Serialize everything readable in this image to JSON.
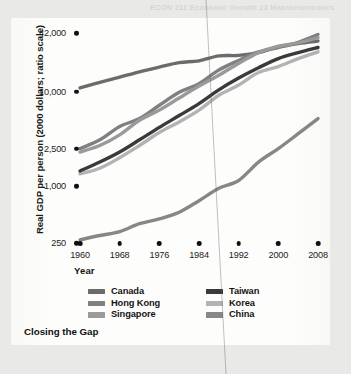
{
  "figure": {
    "caption": "Closing the Gap",
    "ghost_text": "ECON 211 Economic Growth 23 Macroeconomics",
    "card_bg": "#fdfdfc",
    "page_bg": "#e9e9e7"
  },
  "axes": {
    "y_title": "Real GDP per person (2000 dollars; ratio scale)",
    "x_title": "Year",
    "y_ticklabels": [
      "42,000",
      "10,000",
      "2,500",
      "1,000",
      "250"
    ],
    "y_tickvalues": [
      42000,
      10000,
      2500,
      1000,
      250
    ],
    "x_ticklabels": [
      "1960",
      "1968",
      "1976",
      "1984",
      "1992",
      "2000",
      "2008"
    ],
    "x_tickvalues": [
      1960,
      1968,
      1976,
      1984,
      1992,
      2000,
      2008
    ]
  },
  "legend": {
    "left": [
      {
        "label": "Canada",
        "color": "#6b6b6b"
      },
      {
        "label": "Hong Kong",
        "color": "#808080"
      },
      {
        "label": "Singapore",
        "color": "#9a9a9a"
      }
    ],
    "right": [
      {
        "label": "Taiwan",
        "color": "#3a3a3a"
      },
      {
        "label": "Korea",
        "color": "#b3b3b3"
      },
      {
        "label": "China",
        "color": "#878787"
      }
    ]
  },
  "chart_data": {
    "type": "line",
    "title": "Closing the Gap",
    "xlabel": "Year",
    "ylabel": "Real GDP per person (2000 dollars; ratio scale)",
    "yscale": "log",
    "ylim": [
      250,
      42000
    ],
    "xlim": [
      1960,
      2008
    ],
    "grid": false,
    "legend_position": "bottom",
    "x": [
      1960,
      1964,
      1968,
      1972,
      1976,
      1980,
      1984,
      1988,
      1992,
      1996,
      2000,
      2004,
      2008
    ],
    "series": [
      {
        "name": "Canada",
        "color": "#6b6b6b",
        "values": [
          11000,
          12600,
          14300,
          16300,
          18300,
          20400,
          21300,
          24000,
          24300,
          26000,
          30000,
          32500,
          34500
        ]
      },
      {
        "name": "Hong Kong",
        "color": "#808080",
        "values": [
          2500,
          3100,
          4300,
          5200,
          7200,
          9900,
          12200,
          17000,
          21500,
          26500,
          29500,
          33500,
          40500
        ]
      },
      {
        "name": "Singapore",
        "color": "#9a9a9a",
        "values": [
          2300,
          2700,
          3500,
          5000,
          6400,
          8600,
          11500,
          15000,
          20000,
          26000,
          30500,
          33000,
          37500
        ]
      },
      {
        "name": "Taiwan",
        "color": "#3a3a3a",
        "values": [
          1450,
          1800,
          2300,
          3100,
          4200,
          5600,
          7500,
          10500,
          14000,
          18000,
          22500,
          26000,
          29500
        ]
      },
      {
        "name": "Korea",
        "color": "#b3b3b3",
        "values": [
          1350,
          1550,
          2000,
          2700,
          3700,
          4800,
          6400,
          9200,
          11800,
          16000,
          18500,
          22500,
          26500
        ]
      },
      {
        "name": "China",
        "color": "#878787",
        "values": [
          270,
          300,
          330,
          400,
          450,
          530,
          700,
          950,
          1150,
          1800,
          2500,
          3600,
          5200
        ]
      }
    ]
  }
}
